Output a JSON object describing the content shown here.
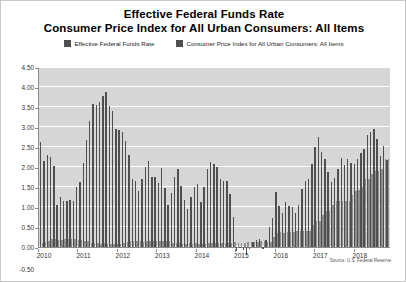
{
  "title": {
    "line1": "Effective Federal Funds Rate",
    "line2": "Consumer Price Index for All Urban Consumers: All Items"
  },
  "legend": [
    {
      "label": "Effective Federal Funds Rate",
      "color": "#4f4f4f",
      "icon": "legend-swatch-icon"
    },
    {
      "label": "Consumer Price Index for All Urban Consumers: All Items",
      "color": "#4f4f4f",
      "icon": "legend-swatch-icon"
    }
  ],
  "source": "Source: U.S. Federal Reserve",
  "colors": {
    "plot_background": "#d6d6d6",
    "gridline": "#ffffff",
    "series_cpi": "#4f4f4f",
    "series_effr": "#8f8f8f",
    "axis": "#8a8a8a"
  },
  "chart_data": {
    "type": "bar",
    "xlabel": "",
    "ylabel": "",
    "ylim": [
      -0.5,
      4.5
    ],
    "yticks": [
      "4.50",
      "4.00",
      "3.50",
      "3.00",
      "2.50",
      "2.00",
      "1.50",
      "1.00",
      "0.50",
      "0.00",
      "-0.50"
    ],
    "ytick_values": [
      4.5,
      4.0,
      3.5,
      3.0,
      2.5,
      2.0,
      1.5,
      1.0,
      0.5,
      0.0,
      -0.5
    ],
    "grid": true,
    "legend_position": "top",
    "xtick_labels": [
      "2010",
      "2011",
      "2012",
      "2013",
      "2014",
      "2015",
      "2016",
      "2017",
      "2018"
    ],
    "x": [
      "2010-01",
      "2010-02",
      "2010-03",
      "2010-04",
      "2010-05",
      "2010-06",
      "2010-07",
      "2010-08",
      "2010-09",
      "2010-10",
      "2010-11",
      "2010-12",
      "2011-01",
      "2011-02",
      "2011-03",
      "2011-04",
      "2011-05",
      "2011-06",
      "2011-07",
      "2011-08",
      "2011-09",
      "2011-10",
      "2011-11",
      "2011-12",
      "2012-01",
      "2012-02",
      "2012-03",
      "2012-04",
      "2012-05",
      "2012-06",
      "2012-07",
      "2012-08",
      "2012-09",
      "2012-10",
      "2012-11",
      "2012-12",
      "2013-01",
      "2013-02",
      "2013-03",
      "2013-04",
      "2013-05",
      "2013-06",
      "2013-07",
      "2013-08",
      "2013-09",
      "2013-10",
      "2013-11",
      "2013-12",
      "2014-01",
      "2014-02",
      "2014-03",
      "2014-04",
      "2014-05",
      "2014-06",
      "2014-07",
      "2014-08",
      "2014-09",
      "2014-10",
      "2014-11",
      "2014-12",
      "2015-01",
      "2015-02",
      "2015-03",
      "2015-04",
      "2015-05",
      "2015-06",
      "2015-07",
      "2015-08",
      "2015-09",
      "2015-10",
      "2015-11",
      "2015-12",
      "2016-01",
      "2016-02",
      "2016-03",
      "2016-04",
      "2016-05",
      "2016-06",
      "2016-07",
      "2016-08",
      "2016-09",
      "2016-10",
      "2016-11",
      "2016-12",
      "2017-01",
      "2017-02",
      "2017-03",
      "2017-04",
      "2017-05",
      "2017-06",
      "2017-07",
      "2017-08",
      "2017-09",
      "2017-10",
      "2017-11",
      "2017-12",
      "2018-01",
      "2018-02",
      "2018-03",
      "2018-04",
      "2018-05",
      "2018-06",
      "2018-07",
      "2018-08",
      "2018-09",
      "2018-10",
      "2018-11"
    ],
    "series": [
      {
        "name": "Consumer Price Index for All Urban Consumers: All Items",
        "color": "#4f4f4f",
        "values": [
          2.63,
          2.14,
          2.31,
          2.24,
          2.02,
          1.05,
          1.24,
          1.15,
          1.14,
          1.17,
          1.14,
          1.5,
          1.63,
          2.11,
          2.68,
          3.16,
          3.57,
          3.56,
          3.63,
          3.77,
          3.87,
          3.53,
          3.39,
          2.96,
          2.93,
          2.87,
          2.65,
          2.3,
          1.7,
          1.66,
          1.41,
          1.69,
          1.99,
          2.16,
          1.76,
          1.74,
          1.59,
          1.98,
          1.47,
          1.06,
          1.36,
          1.75,
          1.96,
          1.52,
          1.18,
          0.96,
          1.24,
          1.5,
          1.58,
          1.13,
          1.51,
          1.95,
          2.13,
          2.07,
          1.99,
          1.7,
          1.66,
          1.66,
          1.32,
          0.76,
          -0.09,
          0.0,
          -0.07,
          -0.2,
          -0.04,
          0.12,
          0.17,
          0.2,
          -0.04,
          0.17,
          0.5,
          0.73,
          1.37,
          1.02,
          0.85,
          1.13,
          1.02,
          1.0,
          0.84,
          1.06,
          1.46,
          1.64,
          1.69,
          2.07,
          2.5,
          2.74,
          2.38,
          2.2,
          1.87,
          1.63,
          1.73,
          1.94,
          2.23,
          2.04,
          2.2,
          2.11,
          2.07,
          2.21,
          2.36,
          2.46,
          2.8,
          2.87,
          2.95,
          2.7,
          2.28,
          2.52,
          2.18
        ]
      },
      {
        "name": "Effective Federal Funds Rate",
        "color": "#8f8f8f",
        "values": [
          0.11,
          0.13,
          0.16,
          0.2,
          0.2,
          0.18,
          0.18,
          0.19,
          0.19,
          0.19,
          0.19,
          0.18,
          0.17,
          0.16,
          0.14,
          0.1,
          0.09,
          0.09,
          0.07,
          0.1,
          0.08,
          0.07,
          0.08,
          0.07,
          0.08,
          0.1,
          0.13,
          0.14,
          0.16,
          0.16,
          0.16,
          0.13,
          0.14,
          0.16,
          0.16,
          0.16,
          0.14,
          0.15,
          0.14,
          0.15,
          0.11,
          0.09,
          0.09,
          0.08,
          0.08,
          0.09,
          0.08,
          0.09,
          0.07,
          0.07,
          0.08,
          0.09,
          0.09,
          0.1,
          0.09,
          0.09,
          0.09,
          0.09,
          0.09,
          0.12,
          0.11,
          0.11,
          0.11,
          0.12,
          0.12,
          0.13,
          0.13,
          0.14,
          0.14,
          0.12,
          0.12,
          0.24,
          0.34,
          0.38,
          0.36,
          0.37,
          0.37,
          0.38,
          0.39,
          0.4,
          0.4,
          0.4,
          0.41,
          0.54,
          0.65,
          0.66,
          0.79,
          0.9,
          0.91,
          1.04,
          1.15,
          1.16,
          1.15,
          1.15,
          1.16,
          1.3,
          1.41,
          1.42,
          1.51,
          1.69,
          1.7,
          1.82,
          1.91,
          1.91,
          1.95,
          2.19,
          2.2
        ]
      }
    ]
  }
}
